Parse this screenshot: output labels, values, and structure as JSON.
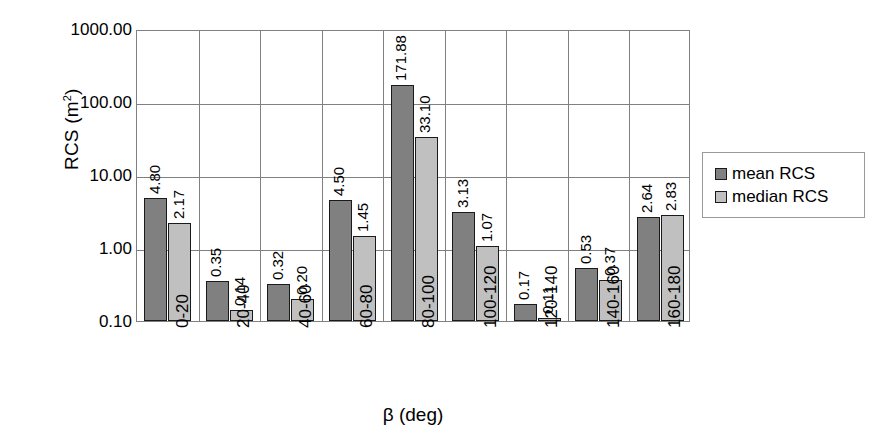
{
  "chart_data": {
    "type": "bar",
    "title": "",
    "xlabel": "β (deg)",
    "ylabel": "RCS (m²)",
    "ylabel_base": "RCS (m",
    "ylabel_exp": "2",
    "ylabel_close": ")",
    "yscale": "log",
    "ylim": [
      0.1,
      1000
    ],
    "grid": true,
    "legend_position": "right",
    "ytick_labels": [
      "1000.00",
      "100.00",
      "10.00",
      "1.00",
      "0.10"
    ],
    "ytick_values": [
      1000,
      100,
      10,
      1,
      0.1
    ],
    "categories": [
      "0-20",
      "20-40",
      "40-60",
      "60-80",
      "80-100",
      "100-120",
      "120-140",
      "140-160",
      "160-180"
    ],
    "series": [
      {
        "name": "mean RCS",
        "color": "#808080",
        "values": [
          4.8,
          0.35,
          0.32,
          4.5,
          171.88,
          3.13,
          0.17,
          0.53,
          2.64
        ],
        "labels": [
          "4.80",
          "0.35",
          "0.32",
          "4.50",
          "171.88",
          "3.13",
          "0.17",
          "0.53",
          "2.64"
        ]
      },
      {
        "name": "median RCS",
        "color": "#c0c0c0",
        "values": [
          2.17,
          0.14,
          0.2,
          1.45,
          33.1,
          1.07,
          0.11,
          0.37,
          2.83
        ],
        "labels": [
          "2.17",
          "0.14",
          "0.20",
          "1.45",
          "33.10",
          "1.07",
          "0.11",
          "0.37",
          "2.83"
        ]
      }
    ]
  },
  "legend": {
    "items": [
      {
        "label": "mean RCS"
      },
      {
        "label": "median RCS"
      }
    ]
  }
}
